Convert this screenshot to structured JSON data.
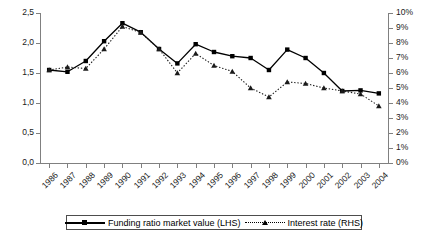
{
  "chart_data": {
    "type": "line",
    "title": "",
    "xlabel": "",
    "grid": false,
    "legend_position": "bottom",
    "categories": [
      "1986",
      "1987",
      "1988",
      "1989",
      "1990",
      "1991",
      "1992",
      "1993",
      "1994",
      "1995",
      "1996",
      "1997",
      "1998",
      "1999",
      "2000",
      "2001",
      "2002",
      "2003",
      "2004"
    ],
    "axes": {
      "left": {
        "label": "",
        "ylim": [
          0,
          2.5
        ],
        "ticks": [
          0,
          0.5,
          1.0,
          1.5,
          2.0,
          2.5
        ],
        "tick_labels": [
          "0,0",
          "0,5",
          "1,0",
          "1,5",
          "2,0",
          "2,5"
        ]
      },
      "right": {
        "label": "",
        "ylim": [
          0,
          10
        ],
        "ticks": [
          0,
          1,
          2,
          3,
          4,
          5,
          6,
          7,
          8,
          9,
          10
        ],
        "tick_labels": [
          "0%",
          "1%",
          "2%",
          "3%",
          "4%",
          "5%",
          "6%",
          "7%",
          "8%",
          "9%",
          "10%"
        ]
      }
    },
    "series": [
      {
        "name": "Funding ratio market value (LHS)",
        "axis": "left",
        "line_style": "solid",
        "marker": "square",
        "color": "#000000",
        "values": [
          1.55,
          1.52,
          1.7,
          2.03,
          2.33,
          2.18,
          1.9,
          1.66,
          1.98,
          1.85,
          1.78,
          1.75,
          1.55,
          1.89,
          1.75,
          1.5,
          1.2,
          1.21,
          1.16
        ]
      },
      {
        "name": "Interest rate (RHS)",
        "axis": "right",
        "line_style": "dotted",
        "marker": "triangle",
        "color": "#1a1a1a",
        "values": [
          6.2,
          6.4,
          6.3,
          7.6,
          9.1,
          8.7,
          7.6,
          6.0,
          7.3,
          6.5,
          6.1,
          5.0,
          4.4,
          5.4,
          5.3,
          5.0,
          4.8,
          4.6,
          3.8
        ]
      }
    ]
  },
  "legend": {
    "items": [
      {
        "label": "Funding ratio market value (LHS)",
        "marker": "square-solid-line"
      },
      {
        "label": "Interest rate (RHS)",
        "marker": "triangle-dotted-line"
      }
    ]
  },
  "caption": {
    "text": ""
  }
}
